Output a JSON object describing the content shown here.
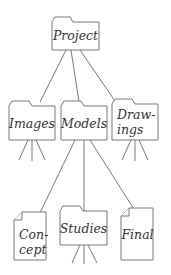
{
  "diagram": {
    "type": "folder-tree",
    "colors": {
      "stroke": "#6a6a6a",
      "text": "#333333",
      "fill": "#ffffff"
    },
    "nodes": {
      "project": {
        "label": "Project",
        "kind": "folder"
      },
      "images": {
        "label": "Images",
        "kind": "folder"
      },
      "models": {
        "label": "Models",
        "kind": "folder"
      },
      "drawings": {
        "line1": "Draw-",
        "line2": "ings",
        "label": "Drawings",
        "kind": "folder"
      },
      "concept": {
        "line1": "Con-",
        "line2": "cept",
        "label": "Concept",
        "kind": "document"
      },
      "studies": {
        "label": "Studies",
        "kind": "folder"
      },
      "final": {
        "label": "Final",
        "kind": "document"
      }
    },
    "edges": [
      [
        "Project",
        "Images"
      ],
      [
        "Project",
        "Models"
      ],
      [
        "Project",
        "Drawings"
      ],
      [
        "Models",
        "Concept"
      ],
      [
        "Models",
        "Studies"
      ],
      [
        "Models",
        "Final"
      ]
    ]
  }
}
